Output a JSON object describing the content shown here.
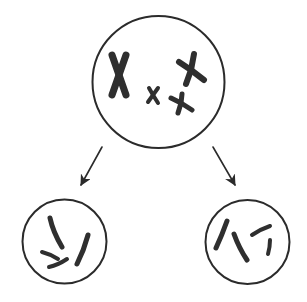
{
  "diagram": {
    "type": "cell-division",
    "colors": {
      "background": "#ffffff",
      "ink": "#2b2b2b",
      "chromosome": "#2f2f2f"
    },
    "parent_cell": {
      "cx": 158.5,
      "cy": 82,
      "r": 66,
      "chromosomes": [
        {
          "name": "large-chromosome",
          "cx": 119,
          "cy": 75,
          "armA": [
            [
              112,
              55
            ],
            [
              126,
              95
            ]
          ],
          "armB": [
            [
              126,
              55
            ],
            [
              112,
              95
            ]
          ],
          "width": 7
        },
        {
          "name": "upper-right-chromosome",
          "cx": 191,
          "cy": 70,
          "armA": [
            [
              179,
              62
            ],
            [
              204,
              80
            ]
          ],
          "armB": [
            [
              194,
              54
            ],
            [
              186,
              84
            ]
          ],
          "width": 6
        },
        {
          "name": "small-chromosome",
          "cx": 153,
          "cy": 95,
          "armA": [
            [
              149,
              88
            ],
            [
              158,
              103
            ]
          ],
          "armB": [
            [
              158,
              88
            ],
            [
              148,
              102
            ]
          ],
          "width": 4
        },
        {
          "name": "medium-chromosome",
          "cx": 181,
          "cy": 103,
          "armA": [
            [
              171,
              98
            ],
            [
              192,
              110
            ]
          ],
          "armB": [
            [
              182,
              94
            ],
            [
              178,
              113
            ]
          ],
          "width": 5
        }
      ]
    },
    "arrows": [
      {
        "name": "arrow-to-left-daughter",
        "from": [
          102,
          147
        ],
        "to": [
          81,
          185
        ]
      },
      {
        "name": "arrow-to-right-daughter",
        "from": [
          213,
          147
        ],
        "to": [
          235,
          185
        ]
      }
    ],
    "daughter_cells": [
      {
        "name": "left-daughter-cell",
        "cx": 64.5,
        "cy": 241.5,
        "r": 42,
        "chromosomes": [
          {
            "path": "M50 218 Q53 232 62 247",
            "width": 5
          },
          {
            "path": "M88 235 Q84 250 77 264",
            "width": 5
          },
          {
            "path": "M42 252 Q50 254 58 259",
            "width": 4
          },
          {
            "path": "M49 267 Q58 265 67 259",
            "width": 4
          }
        ]
      },
      {
        "name": "right-daughter-cell",
        "cx": 247.5,
        "cy": 242,
        "r": 42,
        "chromosomes": [
          {
            "path": "M227 221 Q222 235 216 248",
            "width": 5
          },
          {
            "path": "M234 234 Q239 248 247 260",
            "width": 5
          },
          {
            "path": "M252 235 Q261 229 270 226",
            "width": 4
          },
          {
            "path": "M270 240 Q270 247 268 254",
            "width": 4
          }
        ]
      }
    ]
  }
}
